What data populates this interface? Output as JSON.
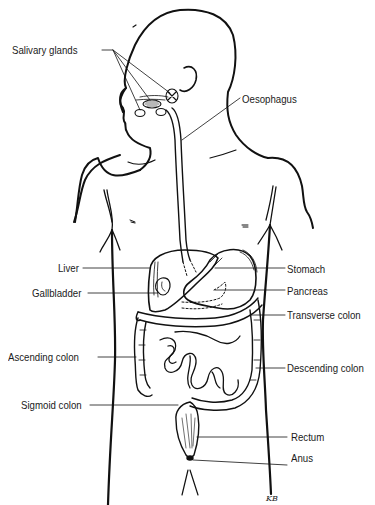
{
  "diagram": {
    "line_color": "#111111",
    "background": "#ffffff",
    "labels": {
      "salivary_glands": "Salivary glands",
      "oesophagus": "Oesophagus",
      "liver": "Liver",
      "gallbladder": "Gallbladder",
      "stomach": "Stomach",
      "pancreas": "Pancreas",
      "transverse_colon": "Transverse colon",
      "ascending_colon": "Ascending colon",
      "descending_colon": "Descending colon",
      "sigmoid_colon": "Sigmoid colon",
      "rectum": "Rectum",
      "anus": "Anus"
    },
    "signature": "KB"
  }
}
